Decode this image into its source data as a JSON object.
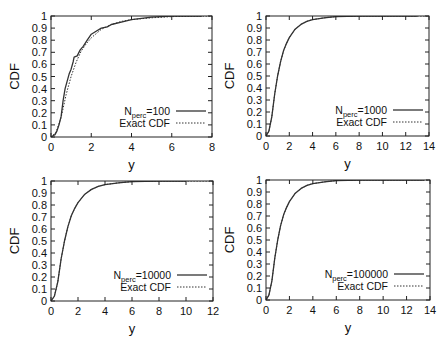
{
  "chart_data": [
    {
      "type": "line",
      "title": "",
      "xlabel": "y",
      "ylabel": "CDF",
      "xlim": [
        0,
        8
      ],
      "ylim": [
        0,
        1
      ],
      "xticks": [
        0,
        2,
        4,
        6,
        8
      ],
      "yticks": [
        0,
        0.1,
        0.2,
        0.3,
        0.4,
        0.5,
        0.6,
        0.7,
        0.8,
        0.9,
        1
      ],
      "grid": false,
      "legend_position": "lower right",
      "frame": {
        "left": 51,
        "right": 212,
        "top": 16,
        "bottom": 137
      },
      "series": [
        {
          "name": "N_perc=100",
          "label_main": "N",
          "label_sub": "perc",
          "label_tail": "=100",
          "style": "solid",
          "x": [
            0,
            0.1,
            0.2,
            0.3,
            0.4,
            0.5,
            0.6,
            0.7,
            0.8,
            0.9,
            1.0,
            1.1,
            1.15,
            1.3,
            1.45,
            1.6,
            1.8,
            2.0,
            2.2,
            2.5,
            2.8,
            3.0,
            3.5,
            4.0,
            4.5,
            5.0,
            6.0,
            7.5
          ],
          "y": [
            0,
            0.01,
            0.02,
            0.05,
            0.1,
            0.17,
            0.3,
            0.4,
            0.46,
            0.52,
            0.56,
            0.62,
            0.66,
            0.67,
            0.72,
            0.75,
            0.8,
            0.85,
            0.87,
            0.9,
            0.91,
            0.93,
            0.95,
            0.97,
            0.98,
            0.99,
            1.0,
            1.0
          ]
        },
        {
          "name": "Exact CDF",
          "label_main": "Exact CDF",
          "label_sub": "",
          "label_tail": "",
          "style": "dotted",
          "x": [
            0,
            0.25,
            0.5,
            0.75,
            1.0,
            1.25,
            1.5,
            1.75,
            2.0,
            2.5,
            3.0,
            3.5,
            4.0,
            5.0,
            6.0,
            7.0,
            8.0
          ],
          "y": [
            0,
            0.04,
            0.16,
            0.35,
            0.5,
            0.62,
            0.71,
            0.77,
            0.82,
            0.89,
            0.93,
            0.955,
            0.97,
            0.985,
            0.995,
            0.998,
            1.0
          ]
        }
      ]
    },
    {
      "type": "line",
      "title": "",
      "xlabel": "y",
      "ylabel": "CDF",
      "xlim": [
        0,
        14
      ],
      "ylim": [
        0,
        1
      ],
      "xticks": [
        0,
        2,
        4,
        6,
        8,
        10,
        12,
        14
      ],
      "yticks": [
        0,
        0.1,
        0.2,
        0.3,
        0.4,
        0.5,
        0.6,
        0.7,
        0.8,
        0.9,
        1
      ],
      "grid": false,
      "legend_position": "lower right",
      "frame": {
        "left": 266,
        "right": 429,
        "top": 16,
        "bottom": 136
      },
      "series": [
        {
          "name": "N_perc=1000",
          "label_main": "N",
          "label_sub": "perc",
          "label_tail": "=1000",
          "style": "solid",
          "x": [
            0,
            0.25,
            0.5,
            0.75,
            1.0,
            1.25,
            1.5,
            1.75,
            2.0,
            2.5,
            3.0,
            3.5,
            4.0,
            5.0,
            6.0,
            8.0,
            10.0,
            13.0
          ],
          "y": [
            0,
            0.04,
            0.16,
            0.35,
            0.5,
            0.62,
            0.71,
            0.77,
            0.82,
            0.89,
            0.93,
            0.955,
            0.97,
            0.985,
            0.995,
            1.0,
            1.0,
            1.0
          ]
        },
        {
          "name": "Exact CDF",
          "label_main": "Exact CDF",
          "label_sub": "",
          "label_tail": "",
          "style": "dotted",
          "x": [
            0,
            0.25,
            0.5,
            0.75,
            1.0,
            1.25,
            1.5,
            1.75,
            2.0,
            2.5,
            3.0,
            3.5,
            4.0,
            5.0,
            6.0,
            8.0,
            10.0,
            14.0
          ],
          "y": [
            0,
            0.04,
            0.16,
            0.35,
            0.5,
            0.62,
            0.71,
            0.77,
            0.82,
            0.89,
            0.93,
            0.955,
            0.97,
            0.985,
            0.995,
            1.0,
            1.0,
            1.0
          ]
        }
      ]
    },
    {
      "type": "line",
      "title": "",
      "xlabel": "y",
      "ylabel": "CDF",
      "xlim": [
        0,
        12
      ],
      "ylim": [
        0,
        1
      ],
      "xticks": [
        0,
        2,
        4,
        6,
        8,
        10,
        12
      ],
      "yticks": [
        0,
        0.1,
        0.2,
        0.3,
        0.4,
        0.5,
        0.6,
        0.7,
        0.8,
        0.9,
        1
      ],
      "grid": false,
      "legend_position": "lower right",
      "frame": {
        "left": 51,
        "right": 213,
        "top": 181,
        "bottom": 301
      },
      "series": [
        {
          "name": "N_perc=10000",
          "label_main": "N",
          "label_sub": "perc",
          "label_tail": "=10000",
          "style": "solid",
          "x": [
            0,
            0.25,
            0.5,
            0.75,
            1.0,
            1.25,
            1.5,
            1.75,
            2.0,
            2.5,
            3.0,
            3.5,
            4.0,
            5.0,
            6.0,
            8.0,
            10.0
          ],
          "y": [
            0,
            0.04,
            0.16,
            0.35,
            0.5,
            0.62,
            0.71,
            0.77,
            0.82,
            0.89,
            0.93,
            0.955,
            0.97,
            0.985,
            0.995,
            1.0,
            1.0
          ]
        },
        {
          "name": "Exact CDF",
          "label_main": "Exact CDF",
          "label_sub": "",
          "label_tail": "",
          "style": "dotted",
          "x": [
            0,
            0.25,
            0.5,
            0.75,
            1.0,
            1.25,
            1.5,
            1.75,
            2.0,
            2.5,
            3.0,
            3.5,
            4.0,
            5.0,
            6.0,
            8.0,
            10.0,
            12.0
          ],
          "y": [
            0,
            0.04,
            0.16,
            0.35,
            0.5,
            0.62,
            0.71,
            0.77,
            0.82,
            0.89,
            0.93,
            0.955,
            0.97,
            0.985,
            0.995,
            1.0,
            1.0,
            1.0
          ]
        }
      ]
    },
    {
      "type": "line",
      "title": "",
      "xlabel": "y",
      "ylabel": "CDF",
      "xlim": [
        0,
        14
      ],
      "ylim": [
        0,
        1
      ],
      "xticks": [
        0,
        2,
        4,
        6,
        8,
        10,
        12,
        14
      ],
      "yticks": [
        0,
        0.1,
        0.2,
        0.3,
        0.4,
        0.5,
        0.6,
        0.7,
        0.8,
        0.9,
        1
      ],
      "grid": false,
      "legend_position": "lower right",
      "frame": {
        "left": 266,
        "right": 430,
        "top": 180,
        "bottom": 300
      },
      "series": [
        {
          "name": "N_perc=100000",
          "label_main": "N",
          "label_sub": "perc",
          "label_tail": "=100000",
          "style": "solid",
          "x": [
            0,
            0.25,
            0.5,
            0.75,
            1.0,
            1.25,
            1.5,
            1.75,
            2.0,
            2.5,
            3.0,
            3.5,
            4.0,
            5.0,
            6.0,
            8.0,
            10.0,
            13.5
          ],
          "y": [
            0,
            0.04,
            0.16,
            0.35,
            0.5,
            0.62,
            0.71,
            0.77,
            0.82,
            0.89,
            0.93,
            0.955,
            0.97,
            0.985,
            0.995,
            1.0,
            1.0,
            1.0
          ]
        },
        {
          "name": "Exact CDF",
          "label_main": "Exact CDF",
          "label_sub": "",
          "label_tail": "",
          "style": "dotted",
          "x": [
            0,
            0.25,
            0.5,
            0.75,
            1.0,
            1.25,
            1.5,
            1.75,
            2.0,
            2.5,
            3.0,
            3.5,
            4.0,
            5.0,
            6.0,
            8.0,
            10.0,
            14.0
          ],
          "y": [
            0,
            0.04,
            0.16,
            0.35,
            0.5,
            0.62,
            0.71,
            0.77,
            0.82,
            0.89,
            0.93,
            0.955,
            0.97,
            0.985,
            0.995,
            1.0,
            1.0,
            1.0
          ]
        }
      ]
    }
  ],
  "colors": {
    "line": "#333333",
    "axis": "#222222",
    "text": "#111111",
    "background": "#ffffff"
  }
}
